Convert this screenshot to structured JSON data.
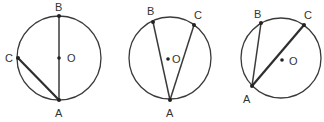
{
  "figures": [
    {
      "id": "fig1",
      "circle": {
        "cx": 59,
        "cy": 58,
        "r": 42
      },
      "points": {
        "A": {
          "x": 59,
          "y": 100,
          "label": "A",
          "lx": 55,
          "ly": 117
        },
        "B": {
          "x": 59,
          "y": 16,
          "label": "B",
          "lx": 55,
          "ly": 11
        },
        "C": {
          "x": 18,
          "y": 58,
          "label": "C",
          "lx": 5,
          "ly": 62
        },
        "O": {
          "x": 59,
          "y": 58,
          "label": "O",
          "lx": 67,
          "ly": 62
        }
      },
      "chords": [
        [
          "A",
          "B"
        ],
        [
          "A",
          "C"
        ]
      ]
    },
    {
      "id": "fig2",
      "circle": {
        "cx": 170,
        "cy": 58,
        "r": 41
      },
      "points": {
        "A": {
          "x": 170,
          "y": 100,
          "label": "A",
          "lx": 166,
          "ly": 117
        },
        "B": {
          "x": 153,
          "y": 22,
          "label": "B",
          "lx": 147,
          "ly": 15
        },
        "C": {
          "x": 194,
          "y": 25,
          "label": "C",
          "lx": 194,
          "ly": 19
        },
        "O": {
          "x": 168,
          "y": 59,
          "label": "O",
          "lx": 172,
          "ly": 63
        }
      },
      "chords": [
        [
          "A",
          "B"
        ],
        [
          "A",
          "C"
        ]
      ]
    },
    {
      "id": "fig3",
      "circle": {
        "cx": 281,
        "cy": 58,
        "r": 40
      },
      "points": {
        "A": {
          "x": 252,
          "y": 86,
          "label": "A",
          "lx": 243,
          "ly": 103
        },
        "B": {
          "x": 261,
          "y": 23,
          "label": "B",
          "lx": 254,
          "ly": 18
        },
        "C": {
          "x": 304,
          "y": 25,
          "label": "C",
          "lx": 304,
          "ly": 19
        },
        "O": {
          "x": 282,
          "y": 60,
          "label": "O",
          "lx": 289,
          "ly": 65
        }
      },
      "chords": [
        [
          "A",
          "B"
        ],
        [
          "A",
          "C"
        ]
      ]
    }
  ]
}
